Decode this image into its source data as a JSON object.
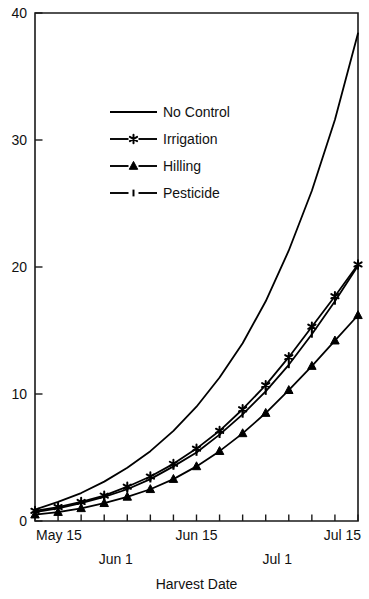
{
  "chart_data": {
    "type": "line",
    "title": "",
    "xlabel": "Harvest Date",
    "ylabel": "",
    "xlim": [
      0,
      14
    ],
    "ylim": [
      0,
      40
    ],
    "grid": false,
    "legend_position": "upper-left-inside",
    "x_tick_labels": [
      "May 15",
      "Jun 1",
      "Jun 15",
      "Jul 1",
      "Jul 15"
    ],
    "x_tick_positions": [
      0,
      3.5,
      7,
      10.5,
      14
    ],
    "y_tick_labels": [
      "0",
      "10",
      "20",
      "30",
      "40"
    ],
    "y_tick_values": [
      0,
      10,
      20,
      30,
      40
    ],
    "x": [
      0,
      1,
      2,
      3,
      4,
      5,
      6,
      7,
      8,
      9,
      10,
      11,
      12,
      13,
      14
    ],
    "series": [
      {
        "name": "No Control",
        "marker": "none",
        "values": [
          0.9,
          1.5,
          2.2,
          3.1,
          4.2,
          5.5,
          7.1,
          9.0,
          11.3,
          14.0,
          17.3,
          21.3,
          26.0,
          31.6,
          38.4
        ]
      },
      {
        "name": "Irrigation",
        "marker": "star",
        "values": [
          0.8,
          1.1,
          1.5,
          2.0,
          2.7,
          3.5,
          4.5,
          5.7,
          7.1,
          8.8,
          10.7,
          12.9,
          15.3,
          17.7,
          20.2
        ]
      },
      {
        "name": "Hilling",
        "marker": "triangle",
        "values": [
          0.5,
          0.7,
          1.0,
          1.4,
          1.9,
          2.5,
          3.3,
          4.3,
          5.5,
          6.9,
          8.5,
          10.3,
          12.2,
          14.2,
          16.2
        ]
      },
      {
        "name": "Pesticide",
        "marker": "dash",
        "values": [
          0.7,
          1.0,
          1.4,
          1.9,
          2.5,
          3.3,
          4.3,
          5.4,
          6.8,
          8.4,
          10.2,
          12.3,
          14.7,
          17.3,
          20.1
        ]
      }
    ]
  },
  "legend": {
    "items": [
      {
        "label": "No Control",
        "marker": "none"
      },
      {
        "label": "Irrigation",
        "marker": "star"
      },
      {
        "label": "Hilling",
        "marker": "triangle"
      },
      {
        "label": "Pesticide",
        "marker": "dash"
      }
    ]
  },
  "axes": {
    "x_title": "Harvest Date"
  }
}
